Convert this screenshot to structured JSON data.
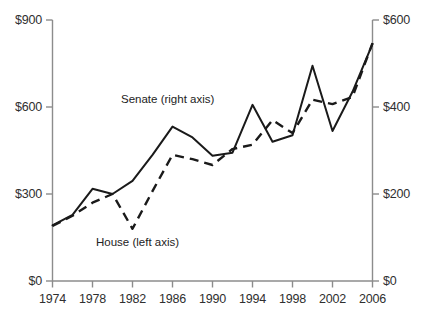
{
  "chart_data": {
    "type": "line",
    "title": "",
    "xlabel": "",
    "ylabel": "",
    "grid": false,
    "legend_position": "inline-annotation",
    "x": [
      1974,
      1976,
      1978,
      1980,
      1982,
      1984,
      1986,
      1988,
      1990,
      1992,
      1994,
      1996,
      1998,
      2000,
      2002,
      2004,
      2006
    ],
    "x_tick_labels": [
      "1974",
      "1978",
      "1982",
      "1986",
      "1990",
      "1994",
      "1998",
      "2002",
      "2006"
    ],
    "x_tick_values": [
      1974,
      1978,
      1982,
      1986,
      1990,
      1994,
      1998,
      2002,
      2006
    ],
    "xlim": [
      1974,
      2006
    ],
    "axes": [
      {
        "id": "left",
        "side": "left",
        "label": "",
        "ylim": [
          0,
          900
        ],
        "tick_values": [
          0,
          300,
          600,
          900
        ],
        "tick_labels": [
          "$0",
          "$300",
          "$600",
          "$900"
        ]
      },
      {
        "id": "right",
        "side": "right",
        "label": "",
        "ylim": [
          0,
          600
        ],
        "tick_values": [
          0,
          200,
          400,
          600
        ],
        "tick_labels": [
          "$0",
          "$200",
          "$400",
          "$600"
        ]
      }
    ],
    "series": [
      {
        "name": "House (left axis)",
        "axis": "left",
        "style": "dashed",
        "color": "#1a1a1a",
        "values": [
          190,
          225,
          270,
          300,
          180,
          310,
          435,
          420,
          400,
          455,
          470,
          555,
          510,
          625,
          610,
          635,
          820
        ]
      },
      {
        "name": "Senate (right axis)",
        "axis": "right",
        "style": "solid",
        "color": "#1a1a1a",
        "values": [
          128,
          152,
          212,
          200,
          230,
          290,
          355,
          330,
          288,
          295,
          405,
          320,
          335,
          495,
          345,
          435,
          545
        ]
      }
    ],
    "annotations": [
      {
        "text": "Senate (right axis)",
        "series": "Senate (right axis)",
        "x": 1985,
        "y": 600
      },
      {
        "text": "House (left axis)",
        "series": "House (left axis)",
        "x": 1983,
        "y": 140
      }
    ]
  },
  "axis_left": {
    "ticks": [
      "$900",
      "$600",
      "$300",
      "$0"
    ]
  },
  "axis_right": {
    "ticks": [
      "$600",
      "$400",
      "$200",
      "$0"
    ]
  },
  "axis_x": {
    "ticks": [
      "1974",
      "1978",
      "1982",
      "1986",
      "1990",
      "1994",
      "1998",
      "2002",
      "2006"
    ]
  },
  "labels": {
    "senate": "Senate (right axis)",
    "house": "House (left axis)"
  },
  "colors": {
    "line": "#1a1a1a",
    "axis": "#8c8c8c",
    "text": "#2f2f2f"
  }
}
